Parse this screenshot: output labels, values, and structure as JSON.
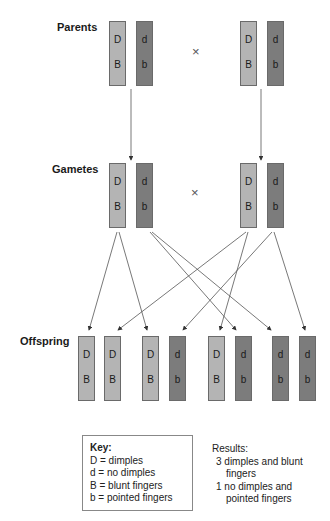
{
  "labels": {
    "parents": "Parents",
    "gametes": "Gametes",
    "offspring": "Offspring",
    "cross_symbol": "×"
  },
  "colors": {
    "dominant_chromosome": "#b4b4b4",
    "recessive_chromosome": "#7c7c7c",
    "arrow": "#555555"
  },
  "parents": [
    {
      "x": 109,
      "alleles": [
        "D",
        "B"
      ],
      "type": "dom"
    },
    {
      "x": 136,
      "alleles": [
        "d",
        "b"
      ],
      "type": "rec"
    },
    {
      "x": 240,
      "alleles": [
        "D",
        "B"
      ],
      "type": "dom"
    },
    {
      "x": 267,
      "alleles": [
        "d",
        "b"
      ],
      "type": "rec"
    }
  ],
  "gametes": [
    {
      "x": 109,
      "alleles": [
        "D",
        "B"
      ],
      "type": "dom"
    },
    {
      "x": 136,
      "alleles": [
        "d",
        "b"
      ],
      "type": "rec"
    },
    {
      "x": 240,
      "alleles": [
        "D",
        "B"
      ],
      "type": "dom"
    },
    {
      "x": 267,
      "alleles": [
        "d",
        "b"
      ],
      "type": "rec"
    }
  ],
  "offspring": [
    {
      "x": 78,
      "alleles": [
        "D",
        "B"
      ],
      "type": "dom"
    },
    {
      "x": 104,
      "alleles": [
        "D",
        "B"
      ],
      "type": "dom"
    },
    {
      "x": 142,
      "alleles": [
        "D",
        "B"
      ],
      "type": "dom"
    },
    {
      "x": 169,
      "alleles": [
        "d",
        "b"
      ],
      "type": "rec"
    },
    {
      "x": 208,
      "alleles": [
        "D",
        "B"
      ],
      "type": "dom"
    },
    {
      "x": 235,
      "alleles": [
        "d",
        "b"
      ],
      "type": "rec"
    },
    {
      "x": 272,
      "alleles": [
        "d",
        "b"
      ],
      "type": "rec"
    },
    {
      "x": 299,
      "alleles": [
        "d",
        "b"
      ],
      "type": "rec"
    }
  ],
  "key": {
    "title": "Key:",
    "items": [
      "D = dimples",
      "d = no dimples",
      "B = blunt fingers",
      "b = pointed fingers"
    ]
  },
  "results": {
    "title": "Results:",
    "lines": [
      " 3 dimples and blunt",
      "    fingers",
      " 1 no dimples and",
      "    pointed fingers"
    ]
  }
}
